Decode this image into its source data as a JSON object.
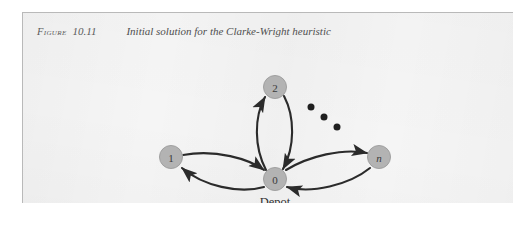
{
  "figure": {
    "caption_label": "Figure",
    "caption_number": "10.11",
    "caption_title": "Initial solution for the Clarke-Wright heuristic"
  },
  "diagram": {
    "type": "node-link-graph",
    "nodes": [
      {
        "id": "1",
        "label": "1",
        "style": "upright",
        "x": 148,
        "y": 118
      },
      {
        "id": "2",
        "label": "2",
        "style": "upright",
        "x": 252,
        "y": 48
      },
      {
        "id": "0",
        "label": "0",
        "style": "upright",
        "x": 252,
        "y": 140,
        "sublabel": "Depot"
      },
      {
        "id": "n",
        "label": "n",
        "style": "italic",
        "x": 356,
        "y": 118
      }
    ],
    "edges": [
      {
        "from": "1",
        "to": "0",
        "direction": "outbound"
      },
      {
        "from": "0",
        "to": "1",
        "direction": "return"
      },
      {
        "from": "0",
        "to": "2",
        "direction": "outbound"
      },
      {
        "from": "2",
        "to": "0",
        "direction": "return"
      },
      {
        "from": "0",
        "to": "n",
        "direction": "outbound"
      },
      {
        "from": "n",
        "to": "0",
        "direction": "return"
      }
    ],
    "ellipsis": {
      "name": "ellipsis-dots",
      "count": 3,
      "meaning": "additional customer nodes omitted"
    },
    "colors": {
      "node_fill": "#b3b3b3",
      "node_stroke": "#9a9a9a",
      "edge": "#2b2b2b",
      "panel_background": "#f5f5f5",
      "caption_text": "#5a5a5a"
    }
  }
}
